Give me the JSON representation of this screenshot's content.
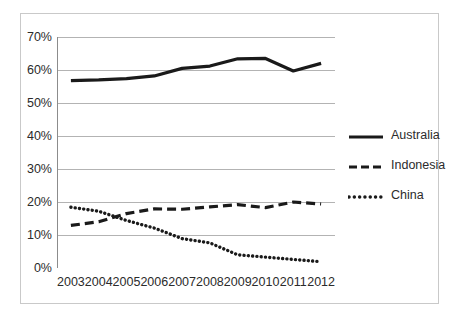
{
  "chart_data": {
    "type": "line",
    "title": "",
    "subtitle": "",
    "xlabel": "",
    "ylabel": "",
    "categories": [
      "2003",
      "2004",
      "2005",
      "2006",
      "2007",
      "2008",
      "2009",
      "2010",
      "2011",
      "2012"
    ],
    "x": [
      2003,
      2004,
      2005,
      2006,
      2007,
      2008,
      2009,
      2010,
      2011,
      2012
    ],
    "ylim": [
      0,
      70
    ],
    "yticks": [
      0,
      10,
      20,
      30,
      40,
      50,
      60,
      70
    ],
    "ytick_labels": [
      "0%",
      "10%",
      "20%",
      "30%",
      "40%",
      "50%",
      "60%",
      "70%"
    ],
    "grid": "horizontal",
    "legend_position": "right",
    "series": [
      {
        "name": "Australia",
        "style": "solid",
        "color": "#1a1a1a",
        "values": [
          56.8,
          57.0,
          57.4,
          58.2,
          60.5,
          61.2,
          63.4,
          63.5,
          59.7,
          62.0
        ]
      },
      {
        "name": "Indonesia",
        "style": "dashed",
        "color": "#1a1a1a",
        "values": [
          12.9,
          14.0,
          16.5,
          17.9,
          17.8,
          18.5,
          19.2,
          18.3,
          20.0,
          19.4
        ]
      },
      {
        "name": "China",
        "style": "dotted",
        "color": "#1a1a1a",
        "values": [
          18.4,
          17.2,
          14.4,
          12.1,
          8.9,
          7.6,
          4.0,
          3.3,
          2.6,
          1.9
        ]
      }
    ]
  },
  "axes": {
    "y_labels": [
      "70%",
      "60%",
      "50%",
      "40%",
      "30%",
      "20%",
      "10%",
      "0%"
    ],
    "x_labels": [
      "2003",
      "2004",
      "2005",
      "2006",
      "2007",
      "2008",
      "2009",
      "2010",
      "2011",
      "2012"
    ]
  },
  "legend": {
    "items": [
      {
        "label": "Australia",
        "style": "solid"
      },
      {
        "label": "Indonesia",
        "style": "dashed"
      },
      {
        "label": "China",
        "style": "dotted"
      }
    ]
  },
  "colors": {
    "line": "#1a1a1a",
    "gridline": "#b3b3b3",
    "axis": "#8c8c8c",
    "frame": "#c9c9c9",
    "text": "#2b2b2b",
    "background": "#ffffff"
  }
}
